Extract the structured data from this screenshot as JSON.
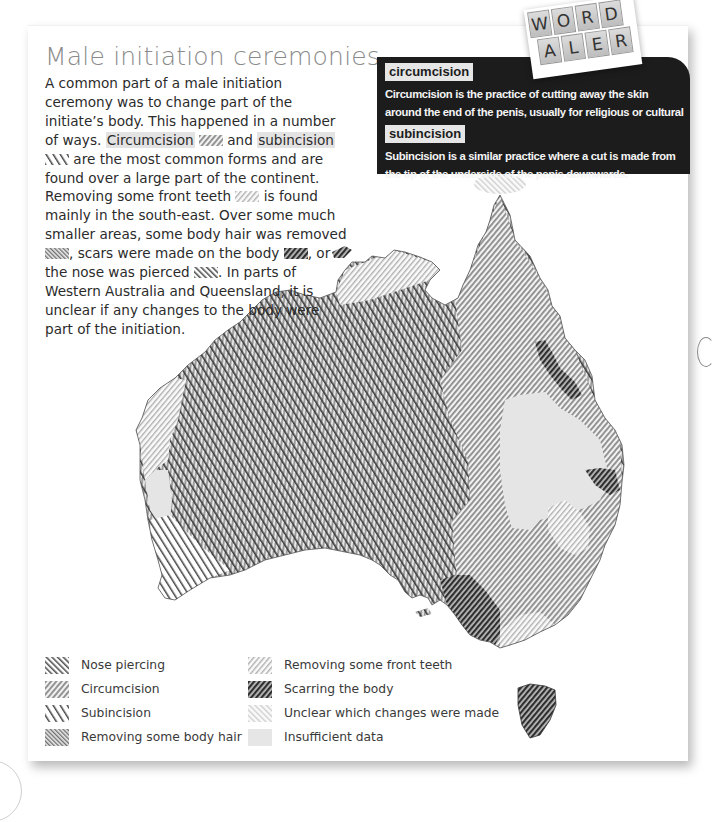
{
  "title": "Male initiation ceremonies",
  "intro": {
    "p1": "A common part of a male initiation ceremony was to change part of the initiate’s body. This happened in a number of ways. ",
    "circumcision_term": "Circumcision",
    "p2": " and ",
    "subincision_term": "subincision",
    "p3": " are the most common forms and are found over a large part of the continent. Removing some front teeth ",
    "p4": " is found mainly in the south-east. Over some much smaller areas, some body hair was removed ",
    "p5": ", scars were made on the body ",
    "p6": ", or the nose was pierced ",
    "p7": ". In parts of Western Australia and Queensland, it is unclear if any changes to the body were part of the initiation."
  },
  "word_alert": {
    "badge_row1": [
      "W",
      "O",
      "R",
      "D"
    ],
    "badge_row2": [
      "A",
      "L",
      "E",
      "R",
      "T"
    ],
    "entries": [
      {
        "term": "circumcision",
        "definition": "Circumcision is the practice of cutting away the skin around the end of the penis, usually for religious or cultural reasons."
      },
      {
        "term": "subincision",
        "definition": "Subincision is a similar practice where a cut is made from the tip of the underside of the penis downwards."
      }
    ]
  },
  "legend": {
    "items": [
      {
        "id": "nose",
        "label": "Nose piercing",
        "icon": "nose-piercing-hatch"
      },
      {
        "id": "circ",
        "label": "Circumcision",
        "icon": "circumcision-hatch"
      },
      {
        "id": "subinc",
        "label": "Subincision",
        "icon": "subincision-hatch"
      },
      {
        "id": "hair",
        "label": "Removing some body hair",
        "icon": "body-hair-hatch"
      },
      {
        "id": "teeth",
        "label": "Removing some front teeth",
        "icon": "front-teeth-hatch"
      },
      {
        "id": "scar",
        "label": "Scarring the body",
        "icon": "scarring-hatch"
      },
      {
        "id": "unclear",
        "label": "Unclear which changes were made",
        "icon": "unclear-hatch"
      },
      {
        "id": "insufficient",
        "label": "Insufficient data",
        "icon": "insufficient-fill"
      }
    ]
  },
  "colors": {
    "page_bg": "#ffffff",
    "title": "#8a8a8a",
    "body_text": "#2b2b2b",
    "alert_bg": "#1c1c1c",
    "term_bg": "#e6e6e6",
    "highlight": "#e3e3e3",
    "insufficient": "#e6e6e6"
  }
}
